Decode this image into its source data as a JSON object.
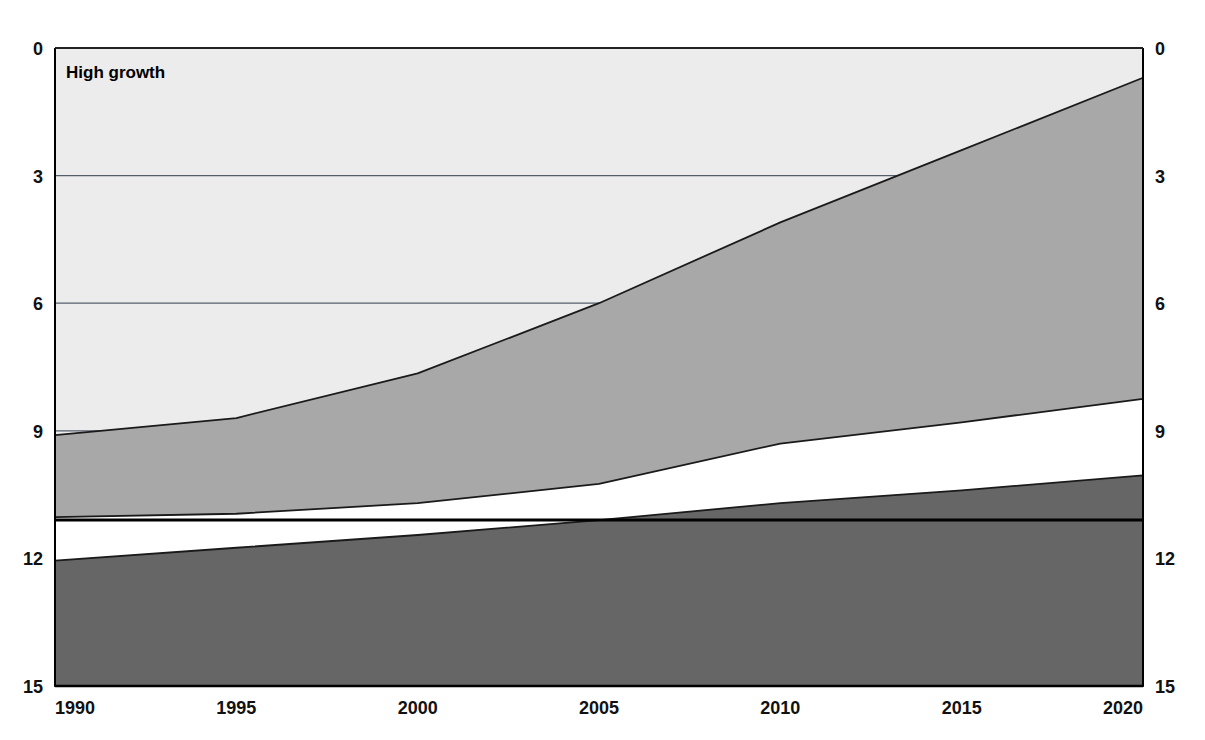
{
  "chart_data": {
    "type": "area",
    "title": "High growth",
    "xlabel": "",
    "ylabel": "",
    "xlim": [
      1990,
      2020
    ],
    "ylim": [
      0,
      15
    ],
    "grid": true,
    "legend_position": "none",
    "x_ticks": [
      1990,
      1995,
      2000,
      2005,
      2010,
      2015,
      2020
    ],
    "x_tick_labels": [
      "1990",
      "1995",
      "2000",
      "2005",
      "2010",
      "2015",
      "2020"
    ],
    "y_ticks": [
      0,
      3,
      6,
      9,
      12,
      15
    ],
    "y_tick_labels_left": [
      "0",
      "3",
      "6",
      "9",
      "12",
      "15"
    ],
    "y_tick_labels_right": [
      "0",
      "3",
      "6",
      "9",
      "12",
      "15"
    ],
    "stacked": true,
    "x": [
      1990,
      1995,
      2000,
      2005,
      2010,
      2015,
      2020
    ],
    "series": [
      {
        "name": "bottom-dark-band",
        "color": "#666666",
        "cumulative_top": [
          2.95,
          3.25,
          3.55,
          3.9,
          4.3,
          4.6,
          4.95
        ],
        "values": [
          2.95,
          3.25,
          3.55,
          3.9,
          4.3,
          4.6,
          4.95
        ]
      },
      {
        "name": "middle-white-band",
        "color": "#ffffff",
        "cumulative_top": [
          3.97,
          4.05,
          4.3,
          4.75,
          5.7,
          6.2,
          6.75
        ],
        "values": [
          1.02,
          0.8,
          0.75,
          0.85,
          1.4,
          1.6,
          1.8
        ]
      },
      {
        "name": "upper-grey-band",
        "color": "#a8a8a8",
        "cumulative_top": [
          5.9,
          6.3,
          7.35,
          9.0,
          10.9,
          12.6,
          14.3
        ],
        "values": [
          1.93,
          2.25,
          3.05,
          4.25,
          5.2,
          6.4,
          7.55
        ]
      }
    ],
    "reference_line": {
      "name": "constant-reference-line",
      "value": 3.9,
      "color": "#000000"
    },
    "plot_background_color": "#ececec",
    "gridline_color": "#555f6b",
    "axis_color": "#000000"
  },
  "axes": {
    "left_tick_labels": [
      "15",
      "12",
      "9",
      "6",
      "3",
      "0"
    ],
    "right_tick_labels": [
      "15",
      "12",
      "9",
      "6",
      "3",
      "0"
    ],
    "bottom_tick_labels": [
      "1990",
      "1995",
      "2000",
      "2005",
      "2010",
      "2015",
      "2020"
    ]
  },
  "panel": {
    "title": "High growth"
  },
  "colors": {
    "plot_bg": "#ececec",
    "band_dark": "#666666",
    "band_white": "#ffffff",
    "band_grey": "#a8a8a8",
    "gridline": "#555f6b",
    "text": "#111111"
  }
}
